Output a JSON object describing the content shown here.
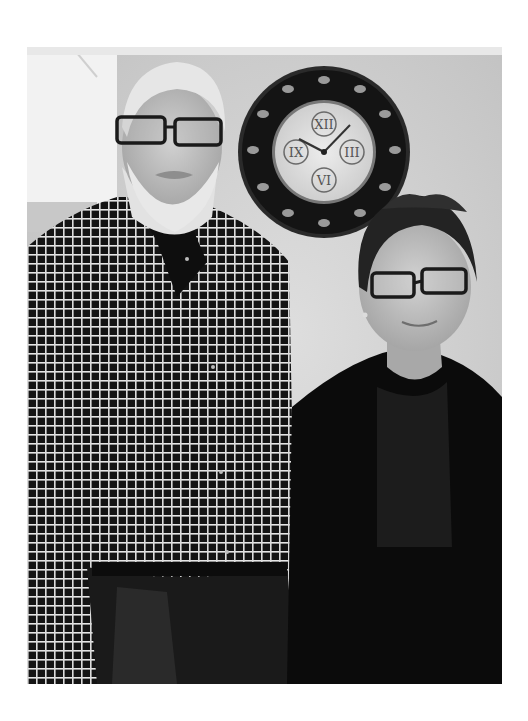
{
  "photo": {
    "description": "Black-and-white photo of an older bearded man in glasses and a checked shirt standing beside a young woman in glasses and a dark cardigan, in front of a wall with a decorative round clock",
    "colors": {
      "wall": "#d4d4d4",
      "wall_light": "#eeeeee",
      "clock_frame": "#1e1e1e",
      "clock_face": "#e6e6e6",
      "shirt": "#151515",
      "cardigan": "#0a0a0a",
      "skin": "#bdbdbd",
      "hair_gray": "#e4e4e4",
      "hair_dark": "#262626"
    },
    "clock": {
      "numerals": [
        "XII",
        "III",
        "VI",
        "IX"
      ]
    },
    "people": [
      {
        "name": "man",
        "features": [
          "white hair",
          "white beard",
          "dark rectangular glasses",
          "checked button-down shirt",
          "jeans"
        ]
      },
      {
        "name": "woman",
        "features": [
          "dark short hair",
          "dark rectangular glasses",
          "earrings",
          "dark cardigan"
        ]
      }
    ]
  }
}
